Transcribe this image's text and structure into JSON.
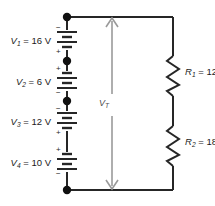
{
  "figure": {
    "background_color": "#ffffff",
    "wire_color": "#262626",
    "arrow_color": "#8c8c8c",
    "text_color": "#1a1a1a"
  },
  "sources": [
    {
      "id": "V1",
      "label_name": "V",
      "label_sub": "1",
      "equals": " = ",
      "value": "16",
      "unit": "V",
      "full_label": "V₁ = 16 V",
      "top_polarity": "−",
      "bottom_polarity": "+"
    },
    {
      "id": "V2",
      "label_name": "V",
      "label_sub": "2",
      "equals": " = ",
      "value": "6",
      "unit": "V",
      "full_label": "V₂ = 6 V",
      "top_polarity": "+",
      "bottom_polarity": "−"
    },
    {
      "id": "V3",
      "label_name": "V",
      "label_sub": "3",
      "equals": " = ",
      "value": "12",
      "unit": "V",
      "full_label": "V₃ = 12 V",
      "top_polarity": "−",
      "bottom_polarity": "+"
    },
    {
      "id": "V4",
      "label_name": "V",
      "label_sub": "4",
      "equals": " = ",
      "value": "10",
      "unit": "V",
      "full_label": "V₄ = 10 V",
      "top_polarity": "+",
      "bottom_polarity": "−"
    }
  ],
  "resistors": [
    {
      "id": "R1",
      "label_name": "R",
      "label_sub": "1",
      "equals": " = ",
      "value": "12",
      "unit": "Ω",
      "full_label": "R₁ = 12 Ω"
    },
    {
      "id": "R2",
      "label_name": "R",
      "label_sub": "2",
      "equals": " = ",
      "value": "18",
      "unit": "Ω",
      "full_label": "R₂ = 18 Ω"
    }
  ],
  "total_voltage": {
    "id": "VT",
    "label_name": "V",
    "label_sub": "T",
    "full_label": "V_T",
    "arrow_style": "double-headed-vertical"
  }
}
